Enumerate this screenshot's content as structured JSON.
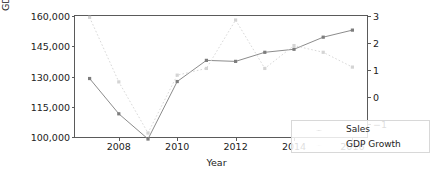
{
  "chart_data": {
    "type": "line",
    "title": "",
    "xlabel": "Year",
    "ylabel": "Sales",
    "ylabel_right": "GDP Growth",
    "x": [
      2007,
      2008,
      2009,
      2010,
      2011,
      2012,
      2013,
      2014,
      2015,
      2016
    ],
    "xlim": [
      2006.5,
      2016.5
    ],
    "xticks": [
      2008,
      2010,
      2012,
      2014,
      2016
    ],
    "xticklabels": [
      "2008",
      "2010",
      "2012",
      "2014",
      "2016"
    ],
    "grid": false,
    "legend_position": "lower right",
    "axes": [
      {
        "side": "left",
        "label": "Sales",
        "ylim": [
          100000,
          160000
        ],
        "yticks": [
          100000,
          115000,
          130000,
          145000,
          160000
        ],
        "yticklabels": [
          "100,000",
          "115,000",
          "130,000",
          "145,000",
          "160,000"
        ]
      },
      {
        "side": "right",
        "label": "GDP Growth",
        "ylim": [
          -1.5,
          3.0
        ],
        "yticks": [
          -1,
          0,
          1,
          2,
          3
        ],
        "yticklabels": [
          "−1",
          "0",
          "1",
          "2",
          "3"
        ]
      }
    ],
    "series": [
      {
        "name": "Sales",
        "axis": "left",
        "color": "#8c8c8c",
        "linestyle": "solid",
        "marker": "square",
        "values": [
          129000,
          111500,
          99000,
          127500,
          138000,
          137500,
          142000,
          143500,
          149500,
          153000
        ]
      },
      {
        "name": "GDP Growth",
        "axis": "right",
        "color": "#d9d9d9",
        "linestyle": "dotted",
        "marker": "square",
        "values": [
          2.95,
          0.55,
          -1.35,
          0.8,
          1.05,
          2.85,
          1.05,
          1.9,
          1.65,
          1.1
        ]
      }
    ],
    "legend_entries": [
      "Sales",
      "GDP Growth"
    ]
  }
}
